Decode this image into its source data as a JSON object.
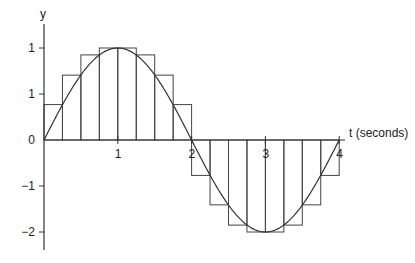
{
  "chart_data": {
    "type": "bar",
    "subtype": "riemann-sum-with-curve",
    "title": "",
    "xlabel": "t (seconds)",
    "ylabel": "y",
    "function": "y = 2 sin(pi t / 2)",
    "xlim": [
      0,
      4
    ],
    "ylim": [
      -2.3,
      2.4
    ],
    "x_ticks": [
      {
        "value": 1,
        "label": "1"
      },
      {
        "value": 2,
        "label": "2"
      },
      {
        "value": 3,
        "label": "3"
      },
      {
        "value": 4,
        "label": "4"
      }
    ],
    "y_ticks": [
      {
        "value": 2,
        "label": "1"
      },
      {
        "value": 1,
        "label": "1"
      },
      {
        "value": 0,
        "label": "0"
      },
      {
        "value": -1,
        "label": "−1"
      },
      {
        "value": -2,
        "label": "−2"
      }
    ],
    "bar_width": 0.25,
    "bars": [
      {
        "x0": 0.0,
        "x1": 0.25,
        "value": 0.77
      },
      {
        "x0": 0.25,
        "x1": 0.5,
        "value": 1.41
      },
      {
        "x0": 0.5,
        "x1": 0.75,
        "value": 1.85
      },
      {
        "x0": 0.75,
        "x1": 1.0,
        "value": 2.0
      },
      {
        "x0": 1.0,
        "x1": 1.25,
        "value": 2.0
      },
      {
        "x0": 1.25,
        "x1": 1.5,
        "value": 1.85
      },
      {
        "x0": 1.5,
        "x1": 1.75,
        "value": 1.41
      },
      {
        "x0": 1.75,
        "x1": 2.0,
        "value": 0.77
      },
      {
        "x0": 2.0,
        "x1": 2.25,
        "value": -0.77
      },
      {
        "x0": 2.25,
        "x1": 2.5,
        "value": -1.41
      },
      {
        "x0": 2.5,
        "x1": 2.75,
        "value": -1.85
      },
      {
        "x0": 2.75,
        "x1": 3.0,
        "value": -2.0
      },
      {
        "x0": 3.0,
        "x1": 3.25,
        "value": -2.0
      },
      {
        "x0": 3.25,
        "x1": 3.5,
        "value": -1.85
      },
      {
        "x0": 3.5,
        "x1": 3.75,
        "value": -1.41
      },
      {
        "x0": 3.75,
        "x1": 4.0,
        "value": -0.77
      }
    ],
    "grid": false,
    "legend": null
  }
}
